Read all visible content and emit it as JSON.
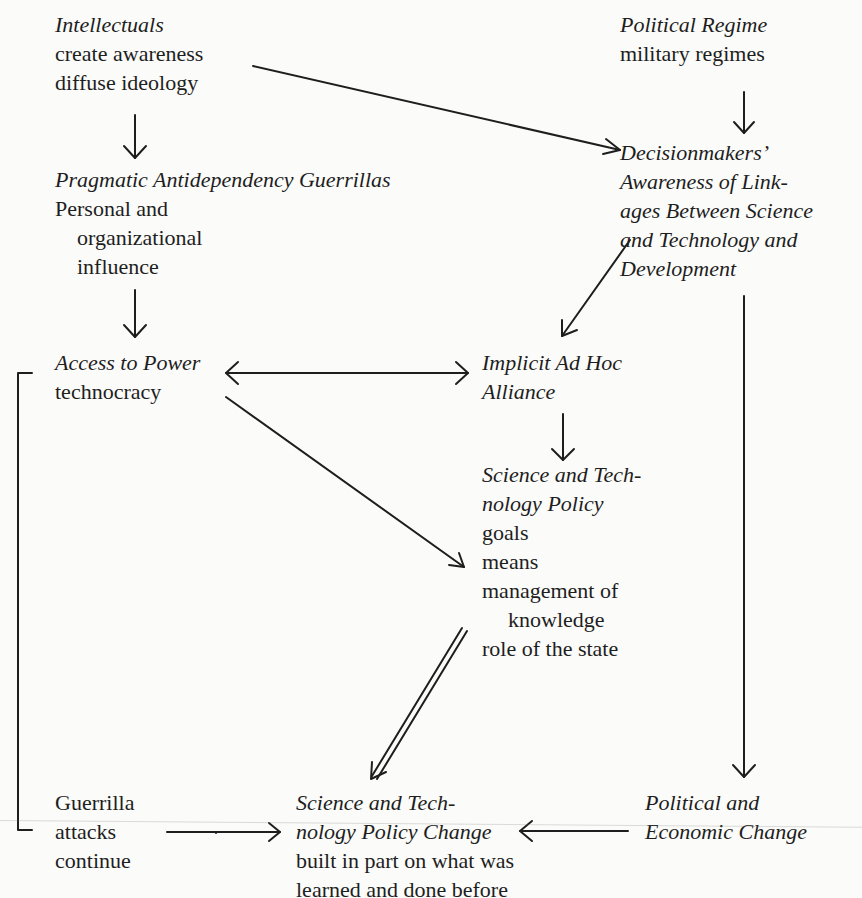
{
  "diagram": {
    "nodes": {
      "intellectuals": {
        "title": "Intellectuals",
        "lines": [
          "create awareness",
          "diffuse ideology"
        ]
      },
      "political_regime": {
        "title": "Political Regime",
        "lines": [
          "military regimes"
        ]
      },
      "guerrillas": {
        "title": "Pragmatic Antidependency Guerrillas",
        "lines": [
          "Personal and",
          "organizational",
          "influence"
        ]
      },
      "decisionmakers": {
        "title_lines": [
          "Decisionmakers’",
          "Awareness of Link-",
          "ages Between Science",
          "and Technology and",
          "Development"
        ]
      },
      "access_to_power": {
        "title": "Access to Power",
        "lines": [
          "technocracy"
        ]
      },
      "alliance": {
        "title_lines": [
          "Implicit Ad Hoc",
          "Alliance"
        ]
      },
      "st_policy": {
        "title_lines": [
          "Science and Tech-",
          "nology Policy"
        ],
        "lines": [
          "goals",
          "means",
          "management of",
          "knowledge",
          "role of the state"
        ]
      },
      "guerrilla_attacks": {
        "lines": [
          "Guerrilla",
          "attacks",
          "continue"
        ]
      },
      "st_policy_change": {
        "title_lines": [
          "Science and Tech-",
          "nology Policy Change"
        ],
        "lines": [
          "built in part on what was",
          "learned and done before"
        ]
      },
      "political_economic_change": {
        "title_lines": [
          "Political and",
          "Economic Change"
        ]
      }
    },
    "edges": [
      {
        "from": "intellectuals",
        "to": "guerrillas",
        "style": "single"
      },
      {
        "from": "intellectuals",
        "to": "decisionmakers",
        "style": "single"
      },
      {
        "from": "political_regime",
        "to": "decisionmakers",
        "style": "single"
      },
      {
        "from": "guerrillas",
        "to": "access_to_power",
        "style": "single"
      },
      {
        "from": "decisionmakers",
        "to": "alliance",
        "style": "single"
      },
      {
        "from": "decisionmakers",
        "to": "political_economic_change",
        "style": "single"
      },
      {
        "from": "access_to_power",
        "to": "alliance",
        "style": "bidirectional"
      },
      {
        "from": "access_to_power",
        "to": "st_policy",
        "style": "single"
      },
      {
        "from": "alliance",
        "to": "st_policy",
        "style": "single"
      },
      {
        "from": "st_policy",
        "to": "st_policy_change",
        "style": "double"
      },
      {
        "from": "guerrilla_attacks",
        "to": "st_policy_change",
        "style": "single"
      },
      {
        "from": "political_economic_change",
        "to": "st_policy_change",
        "style": "single"
      },
      {
        "from": "access_to_power",
        "to": "guerrilla_attacks",
        "style": "bracket"
      }
    ],
    "colors": {
      "ink": "#1e1e1e",
      "paper": "#fbfbf9"
    }
  }
}
